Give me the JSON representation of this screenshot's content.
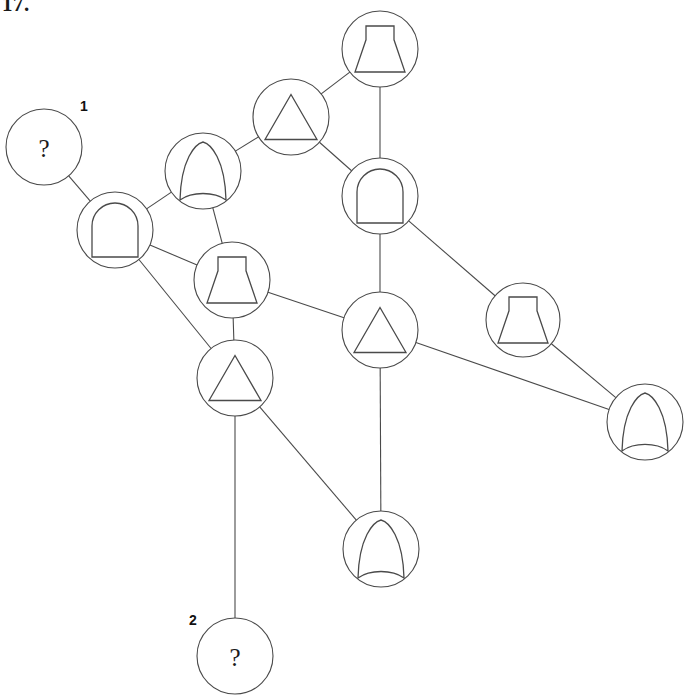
{
  "page": {
    "corner_text": "17.",
    "width": 685,
    "height": 695,
    "background_color": "#ffffff",
    "stroke_color": "#4a4a4a",
    "text_color": "#1a1a1a"
  },
  "legend": {
    "shape_names": [
      "arch",
      "pointed-arch",
      "bell",
      "triangle",
      "question-mark"
    ]
  },
  "graph": {
    "node_radius": 38,
    "nodes": [
      {
        "id": 1,
        "shape": "question-mark",
        "cx": 44,
        "cy": 147,
        "r": 38,
        "text": "?",
        "label": "1",
        "label_x": 84,
        "label_y": 106
      },
      {
        "id": 2,
        "shape": "arch",
        "cx": 115,
        "cy": 230,
        "r": 38,
        "text": "",
        "label": "",
        "label_x": 0,
        "label_y": 0
      },
      {
        "id": 3,
        "shape": "pointed-arch",
        "cx": 203,
        "cy": 171,
        "r": 38,
        "text": "",
        "label": "",
        "label_x": 0,
        "label_y": 0
      },
      {
        "id": 4,
        "shape": "triangle",
        "cx": 291,
        "cy": 117,
        "r": 38,
        "text": "",
        "label": "",
        "label_x": 0,
        "label_y": 0
      },
      {
        "id": 5,
        "shape": "bell",
        "cx": 380,
        "cy": 49,
        "r": 38,
        "text": "",
        "label": "",
        "label_x": 0,
        "label_y": 0
      },
      {
        "id": 6,
        "shape": "arch",
        "cx": 380,
        "cy": 196,
        "r": 38,
        "text": "",
        "label": "",
        "label_x": 0,
        "label_y": 0
      },
      {
        "id": 7,
        "shape": "bell",
        "cx": 232,
        "cy": 280,
        "r": 38,
        "text": "",
        "label": "",
        "label_x": 0,
        "label_y": 0
      },
      {
        "id": 8,
        "shape": "triangle",
        "cx": 380,
        "cy": 330,
        "r": 38,
        "text": "",
        "label": "",
        "label_x": 0,
        "label_y": 0
      },
      {
        "id": 9,
        "shape": "bell",
        "cx": 523,
        "cy": 320,
        "r": 37,
        "text": "",
        "label": "",
        "label_x": 0,
        "label_y": 0
      },
      {
        "id": 10,
        "shape": "pointed-arch",
        "cx": 645,
        "cy": 422,
        "r": 38,
        "text": "",
        "label": "",
        "label_x": 0,
        "label_y": 0
      },
      {
        "id": 11,
        "shape": "triangle",
        "cx": 235,
        "cy": 378,
        "r": 38,
        "text": "",
        "label": "",
        "label_x": 0,
        "label_y": 0
      },
      {
        "id": 12,
        "shape": "pointed-arch",
        "cx": 381,
        "cy": 549,
        "r": 38,
        "text": "",
        "label": "",
        "label_x": 0,
        "label_y": 0
      },
      {
        "id": 13,
        "shape": "question-mark",
        "cx": 235,
        "cy": 656,
        "r": 38,
        "text": "?",
        "label": "2",
        "label_x": 193,
        "label_y": 620
      }
    ],
    "edges": [
      {
        "from": 1,
        "to": 2
      },
      {
        "from": 2,
        "to": 3
      },
      {
        "from": 2,
        "to": 7
      },
      {
        "from": 2,
        "to": 11
      },
      {
        "from": 3,
        "to": 4
      },
      {
        "from": 3,
        "to": 7
      },
      {
        "from": 4,
        "to": 5
      },
      {
        "from": 4,
        "to": 6
      },
      {
        "from": 5,
        "to": 6
      },
      {
        "from": 6,
        "to": 8
      },
      {
        "from": 6,
        "to": 9
      },
      {
        "from": 7,
        "to": 8
      },
      {
        "from": 7,
        "to": 11
      },
      {
        "from": 8,
        "to": 10
      },
      {
        "from": 8,
        "to": 12
      },
      {
        "from": 9,
        "to": 10
      },
      {
        "from": 11,
        "to": 12
      },
      {
        "from": 11,
        "to": 13
      }
    ]
  }
}
